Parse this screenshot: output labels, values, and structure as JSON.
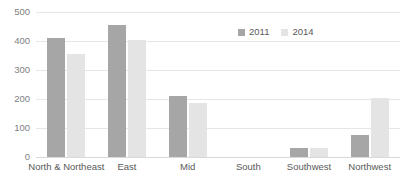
{
  "chart_data": {
    "type": "bar",
    "title": "",
    "subtitle": "",
    "xlabel": "",
    "ylabel": "",
    "ylim": [
      0,
      500
    ],
    "yticks": [
      0,
      100,
      200,
      300,
      400,
      500
    ],
    "ytick_labels": [
      "0",
      "100",
      "200",
      "300",
      "400",
      "500"
    ],
    "grid": true,
    "legend_position": "top-center",
    "categories": [
      "North & Northeast",
      "East",
      "Mid",
      "South",
      "Southwest",
      "Northwest"
    ],
    "series": [
      {
        "name": "2011",
        "color": "#a6a6a6",
        "values": [
          410,
          455,
          210,
          0,
          31,
          76
        ]
      },
      {
        "name": "2014",
        "color": "#e4e4e4",
        "values": [
          355,
          402,
          185,
          0,
          31,
          205
        ]
      }
    ]
  },
  "legend": {
    "items": [
      {
        "label": "2011",
        "color": "#a6a6a6"
      },
      {
        "label": "2014",
        "color": "#e4e4e4"
      }
    ]
  },
  "axis": {
    "y_tick_labels": [
      "500",
      "400",
      "300",
      "200",
      "100",
      "0"
    ],
    "x_tick_labels": [
      "North & Northeast",
      "East",
      "Mid",
      "South",
      "Southwest",
      "Northwest"
    ]
  },
  "colors": {
    "series_2011": "#a6a6a6",
    "series_2014": "#e4e4e4",
    "gridline": "#e6e6e6",
    "axis_text": "#7f7f7f",
    "category_text": "#595959",
    "background": "#ffffff"
  }
}
